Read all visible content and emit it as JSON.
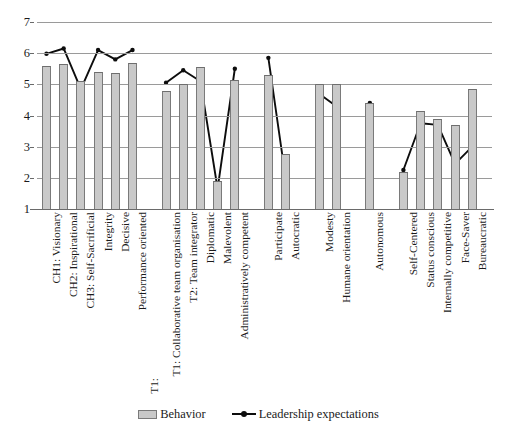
{
  "chart_data": {
    "type": "bar",
    "title": "",
    "subtitle": "",
    "xlabel": "",
    "ylabel": "",
    "ylim": [
      1,
      7
    ],
    "ytick_labels": [
      "7",
      "6",
      "5",
      "4",
      "3",
      "2",
      "1"
    ],
    "ytick_values": [
      7,
      6,
      5,
      4,
      3,
      2,
      1
    ],
    "grid": true,
    "legend_position": "bottom-center",
    "categories": [
      "CH1: Visionary",
      "CH2: Inspirational",
      "CH3: Self-Sacrificial",
      "Integrity",
      "Decisive",
      "Performance oriented",
      "T1: Collaborative team organisation",
      "T2: Team integrator",
      "Diplomatic",
      "Malevolent",
      "Administratively competent",
      "Participate",
      "Autocratic",
      "Modesty",
      "Humane orientation",
      "Autonomous",
      "Self-Centered",
      "Status conscious",
      "Internally competitive",
      "Face-Saver",
      "Bureaucratic"
    ],
    "group_breaks_after": [
      5,
      10,
      12,
      14,
      15
    ],
    "series": [
      {
        "name": "Behavior",
        "type": "bar",
        "values": [
          5.6,
          5.65,
          5.1,
          5.4,
          5.35,
          5.7,
          4.8,
          5.0,
          5.55,
          1.9,
          5.15,
          5.3,
          2.75,
          5.0,
          5.0,
          4.4,
          2.2,
          4.15,
          3.9,
          3.7,
          4.85
        ]
      },
      {
        "name": "Leadership expectations",
        "type": "line",
        "values": [
          5.98,
          6.15,
          4.85,
          6.1,
          5.8,
          6.1,
          5.05,
          5.45,
          5.1,
          1.65,
          5.5,
          5.85,
          2.0,
          4.7,
          4.3,
          4.4,
          2.25,
          3.75,
          3.7,
          2.45,
          3.0
        ]
      }
    ],
    "annotations": [
      "T1:"
    ],
    "colors": {
      "bar_fill": "#c9c9c9",
      "bar_pattern": "#8d8d8d",
      "bar_border": "#7a7a7a",
      "line": "#0d0d0d",
      "gridline": "#9a9a9a",
      "axis": "#6a6a6a",
      "text": "#1a1a1a"
    }
  },
  "legend": {
    "entries": [
      {
        "label": "Behavior",
        "marker": "hatched-bar-swatch"
      },
      {
        "label": "Leadership expectations",
        "marker": "line-with-dot-marker"
      }
    ]
  },
  "group_marker": {
    "text": "T1:"
  }
}
